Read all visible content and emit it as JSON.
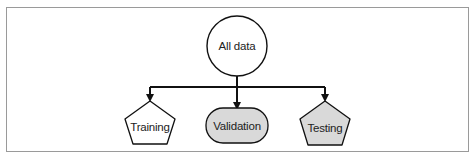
{
  "diagram": {
    "root": {
      "label": "All data",
      "shape": "circle",
      "fill": "#ffffff"
    },
    "children": [
      {
        "label": "Training",
        "shape": "pentagon",
        "fill": "#ffffff"
      },
      {
        "label": "Validation",
        "shape": "rounded-rect",
        "fill": "#d9d9d9"
      },
      {
        "label": "Testing",
        "shape": "pentagon",
        "fill": "#d9d9d9"
      }
    ],
    "edges": [
      {
        "from": "All data",
        "to": "Training"
      },
      {
        "from": "All data",
        "to": "Validation"
      },
      {
        "from": "All data",
        "to": "Testing"
      }
    ]
  }
}
